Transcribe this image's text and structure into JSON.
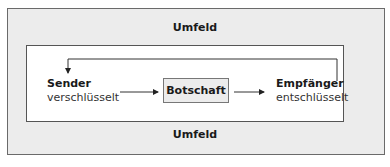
{
  "diagram": {
    "environment_label_top": "Umfeld",
    "environment_label_bottom": "Umfeld",
    "sender": {
      "title": "Sender",
      "subtitle": "verschlüsselt"
    },
    "message": {
      "label": "Botschaft"
    },
    "receiver": {
      "title": "Empfänger",
      "subtitle": "entschlüsselt"
    },
    "edges": [
      {
        "from": "sender",
        "to": "message"
      },
      {
        "from": "message",
        "to": "receiver"
      },
      {
        "from": "receiver",
        "to": "sender",
        "type": "feedback"
      }
    ],
    "colors": {
      "environment_fill": "#ececec",
      "message_fill": "#ececec",
      "line": "#333333"
    }
  }
}
